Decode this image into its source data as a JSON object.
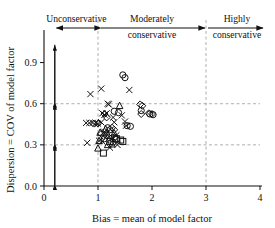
{
  "figure": {
    "zones": [
      {
        "name": "unconservative",
        "label": "Unconservative",
        "label2": "",
        "x_start": 0.0,
        "x_end": 1.0
      },
      {
        "name": "moderately-conservative",
        "label": "Moderately",
        "label2": "conservative",
        "x_start": 1.0,
        "x_end": 3.0
      },
      {
        "name": "highly-conservative",
        "label": "Highly",
        "label2": "conservative",
        "x_start": 3.0,
        "x_end": 4.0
      }
    ]
  },
  "chart_data": {
    "type": "scatter",
    "title": "",
    "xlabel": "Bias = mean of model factor",
    "ylabel": "Dispersion = COV of model factor",
    "xlim": [
      0,
      4
    ],
    "ylim": [
      0.0,
      1.05
    ],
    "xticks": [
      "0",
      "1",
      "2",
      "3",
      "4"
    ],
    "xtick_values": [
      0,
      1,
      2,
      3,
      4
    ],
    "yticks": [
      "0.0",
      "0.3",
      "0.6",
      "0.9"
    ],
    "ytick_values": [
      0.0,
      0.3,
      0.6,
      0.9
    ],
    "grid": "dashed gridlines at y = 0.3, y = 0.6 and x = 1, x = 3",
    "gridlines_x": [
      1,
      3
    ],
    "gridlines_y": [
      0.3,
      0.6
    ],
    "legend": "none",
    "annotations": {
      "vertical_double_arrow_x": 0.2,
      "vertical_arrow_segments": [
        [
          0.0,
          0.3
        ],
        [
          0.3,
          0.6
        ],
        [
          0.6,
          1.03
        ]
      ],
      "zone_arrows": [
        {
          "label": "Unconservative",
          "from": 0.2,
          "to": 1.0,
          "direction": "left"
        },
        {
          "label": "Moderately conservative",
          "from": 1.0,
          "to": 3.0,
          "direction": "both"
        },
        {
          "label": "Highly conservative",
          "from": 3.0,
          "to": 4.0,
          "direction": "right"
        }
      ]
    },
    "series": [
      {
        "name": "cross",
        "marker": "x",
        "points": [
          [
            0.86,
            0.67
          ],
          [
            1.06,
            0.71
          ],
          [
            1.58,
            0.7
          ],
          [
            1.08,
            0.53
          ],
          [
            1.12,
            0.52
          ],
          [
            1.16,
            0.53
          ],
          [
            1.18,
            0.6
          ],
          [
            1.2,
            0.595
          ],
          [
            0.78,
            0.46
          ],
          [
            0.84,
            0.46
          ],
          [
            0.9,
            0.46
          ],
          [
            0.96,
            0.46
          ],
          [
            1.0,
            0.455
          ],
          [
            1.06,
            0.465
          ],
          [
            1.28,
            0.5
          ],
          [
            1.3,
            0.465
          ],
          [
            1.44,
            0.515
          ],
          [
            1.5,
            0.47
          ],
          [
            1.52,
            0.44
          ],
          [
            1.12,
            0.395
          ],
          [
            1.16,
            0.38
          ],
          [
            0.8,
            0.315
          ],
          [
            1.02,
            0.33
          ],
          [
            1.08,
            0.325
          ],
          [
            1.24,
            0.345
          ],
          [
            1.34,
            0.37
          ],
          [
            1.36,
            0.3
          ],
          [
            1.22,
            0.28
          ]
        ]
      },
      {
        "name": "circle",
        "marker": "o",
        "points": [
          [
            1.46,
            0.81
          ],
          [
            1.5,
            0.79
          ],
          [
            1.3,
            0.545
          ],
          [
            1.38,
            0.535
          ],
          [
            1.8,
            0.55
          ],
          [
            1.96,
            0.525
          ],
          [
            2.02,
            0.52
          ],
          [
            1.54,
            0.44
          ],
          [
            1.6,
            0.435
          ],
          [
            1.18,
            0.425
          ],
          [
            1.22,
            0.41
          ],
          [
            1.3,
            0.355
          ],
          [
            1.34,
            0.34
          ],
          [
            1.28,
            0.32
          ],
          [
            1.16,
            0.37
          ],
          [
            1.12,
            0.345
          ]
        ]
      },
      {
        "name": "diamond",
        "marker": "d",
        "points": [
          [
            1.12,
            0.525
          ],
          [
            1.16,
            0.5
          ],
          [
            0.92,
            0.455
          ],
          [
            1.0,
            0.455
          ],
          [
            1.78,
            0.595
          ],
          [
            1.82,
            0.585
          ],
          [
            1.8,
            0.525
          ],
          [
            1.94,
            0.53
          ],
          [
            2.0,
            0.525
          ],
          [
            1.26,
            0.425
          ],
          [
            1.3,
            0.41
          ],
          [
            1.06,
            0.38
          ],
          [
            1.1,
            0.365
          ],
          [
            1.2,
            0.355
          ]
        ]
      },
      {
        "name": "triangle",
        "marker": "t",
        "points": [
          [
            1.4,
            0.585
          ],
          [
            1.04,
            0.39
          ],
          [
            1.14,
            0.415
          ],
          [
            1.3,
            0.385
          ],
          [
            1.02,
            0.33
          ],
          [
            1.0,
            0.275
          ],
          [
            1.18,
            0.3
          ],
          [
            1.26,
            0.305
          ]
        ]
      },
      {
        "name": "square",
        "marker": "s",
        "points": [
          [
            1.34,
            0.345
          ],
          [
            1.42,
            0.335
          ],
          [
            1.46,
            0.325
          ],
          [
            1.22,
            0.325
          ],
          [
            1.1,
            0.24
          ]
        ]
      }
    ]
  }
}
